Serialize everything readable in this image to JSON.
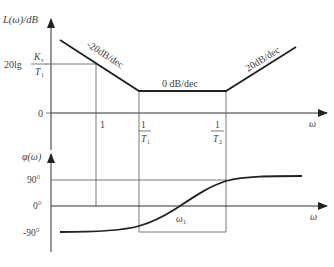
{
  "magnitude_plot": {
    "y_axis_label": "L(ω)/dB",
    "x_axis_label": "ω",
    "y_tick_top": {
      "prefix": "20lg",
      "numerator": "K",
      "numerator_sub": "v",
      "denominator": "T",
      "denominator_sub": "1"
    },
    "y_tick_zero": "0",
    "x_ticks": [
      {
        "label": "1"
      },
      {
        "numerator": "1",
        "denominator": "T",
        "denominator_sub": "1"
      },
      {
        "numerator": "1",
        "denominator": "T",
        "denominator_sub": "2"
      }
    ],
    "segments": [
      {
        "label": "-20dB/dec"
      },
      {
        "label": "0 dB/dec"
      },
      {
        "label": "20dB/dec"
      }
    ]
  },
  "phase_plot": {
    "y_axis_label": "φ(ω)",
    "x_axis_label": "ω",
    "y_ticks": [
      "90°",
      "0°",
      "-90°"
    ],
    "crossing_label": "ω",
    "crossing_label_sub": "1"
  },
  "colors": {
    "axis": "#333333",
    "curve": "#222222",
    "guide": "#555555",
    "text": "#444444"
  }
}
